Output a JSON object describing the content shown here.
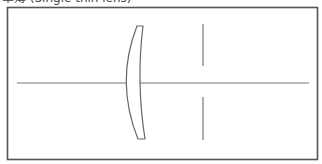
{
  "caption": "单薄 (Single thin lens)",
  "diagram": {
    "type": "optical-layout",
    "elements": [
      {
        "kind": "optical-axis",
        "label": ""
      },
      {
        "kind": "concave-meniscus-lens",
        "label": ""
      },
      {
        "kind": "aperture-stop",
        "label": ""
      }
    ],
    "colors": {
      "frame": "#555555",
      "lines": "#666666",
      "lens_fill": "#ffffff"
    }
  }
}
